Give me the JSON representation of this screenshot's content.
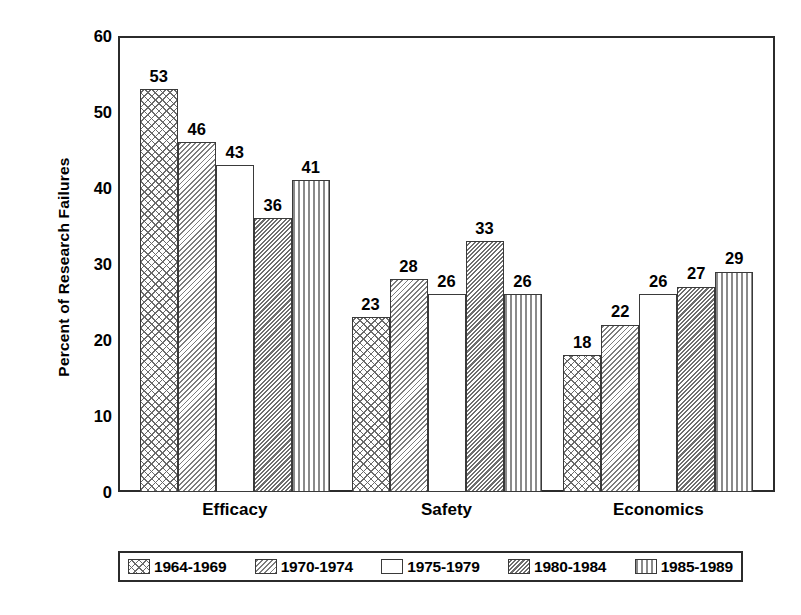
{
  "chart_data": {
    "type": "bar",
    "title": "",
    "xlabel": "",
    "ylabel": "Percent of Research Failures",
    "ylim": [
      0,
      60
    ],
    "yticks": [
      0,
      10,
      20,
      30,
      40,
      50,
      60
    ],
    "grid": false,
    "legend_position": "bottom",
    "categories": [
      "Efficacy",
      "Safety",
      "Economics"
    ],
    "series": [
      {
        "name": "1964-1969",
        "pattern": "crosshatch",
        "values": [
          53,
          23,
          18
        ]
      },
      {
        "name": "1970-1974",
        "pattern": "diag-light",
        "values": [
          46,
          28,
          22
        ]
      },
      {
        "name": "1975-1979",
        "pattern": "blank",
        "values": [
          43,
          26,
          26
        ]
      },
      {
        "name": "1980-1984",
        "pattern": "diag-dense",
        "values": [
          36,
          33,
          27
        ]
      },
      {
        "name": "1985-1989",
        "pattern": "vert",
        "values": [
          41,
          26,
          29
        ]
      }
    ]
  },
  "axes": {
    "y_title": "Percent of Research Failures",
    "y_tick_labels": [
      "60",
      "50",
      "40",
      "30",
      "20",
      "10",
      "0"
    ],
    "x_tick_labels": [
      "Efficacy",
      "Safety",
      "Economics"
    ]
  },
  "legend": {
    "items": [
      {
        "label": "1964-1969",
        "pattern": "crosshatch"
      },
      {
        "label": "1970-1974",
        "pattern": "diag-light"
      },
      {
        "label": "1975-1979",
        "pattern": "blank"
      },
      {
        "label": "1980-1984",
        "pattern": "diag-dense"
      },
      {
        "label": "1985-1989",
        "pattern": "vert"
      }
    ]
  },
  "colors": {
    "background": "#ffffff",
    "axis": "#2b2b2b",
    "text": "#000000",
    "hatch": "#6a6a6a"
  }
}
